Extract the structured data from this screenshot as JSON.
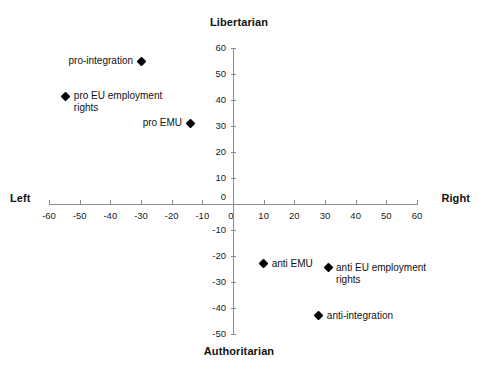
{
  "chart_data": {
    "type": "scatter",
    "title": "",
    "xlabel": "Left – Right",
    "ylabel": "Authoritarian – Libertarian",
    "axis_titles": {
      "top": "Libertarian",
      "bottom": "Authoritarian",
      "left": "Left",
      "right": "Right"
    },
    "xlim": [
      -60,
      60
    ],
    "ylim": [
      -50,
      60
    ],
    "grid": false,
    "legend": "none",
    "xticks": [
      -60,
      -50,
      -40,
      -30,
      -20,
      -10,
      0,
      10,
      20,
      30,
      40,
      50,
      60
    ],
    "xticklabels": [
      "-60",
      "-50",
      "-40",
      "-30",
      "-20",
      "-10",
      "0",
      "10",
      "20",
      "30",
      "40",
      "50",
      "60"
    ],
    "yticks": [
      -50,
      -40,
      -30,
      -20,
      -10,
      0,
      10,
      20,
      30,
      40,
      50,
      60
    ],
    "yticklabels": [
      "-50",
      "-40",
      "-30",
      "-20",
      "-10",
      "0",
      "10",
      "20",
      "30",
      "40",
      "50",
      "60"
    ],
    "marker": "diamond",
    "marker_color": "#000000",
    "axis_color": "#8c8c8c",
    "points": [
      {
        "label": "pro-integration",
        "x": -30,
        "y": 55,
        "label_side": "left"
      },
      {
        "label": "pro EU employment\nrights",
        "x": -54.5,
        "y": 41.5,
        "label_side": "right"
      },
      {
        "label": "pro EMU",
        "x": -14,
        "y": 31,
        "label_side": "left"
      },
      {
        "label": "anti EMU",
        "x": 10,
        "y": -23,
        "label_side": "right"
      },
      {
        "label": "anti EU employment\nrights",
        "x": 31,
        "y": -24.5,
        "label_side": "right"
      },
      {
        "label": "anti-integration",
        "x": 28,
        "y": -43,
        "label_side": "right"
      }
    ]
  }
}
